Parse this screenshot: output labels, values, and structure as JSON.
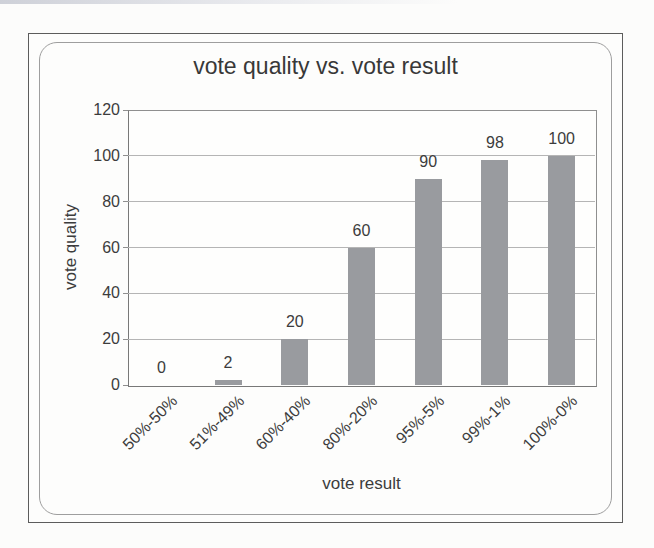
{
  "chart_data": {
    "type": "bar",
    "title": "vote quality vs. vote result",
    "xlabel": "vote result",
    "ylabel": "vote quality",
    "categories": [
      "50%-50%",
      "51%-49%",
      "60%-40%",
      "80%-20%",
      "95%-5%",
      "99%-1%",
      "100%-0%"
    ],
    "values": [
      0,
      2,
      20,
      60,
      90,
      98,
      100
    ],
    "data_labels": [
      "0",
      "2",
      "20",
      "60",
      "90",
      "98",
      "100"
    ],
    "yticks": [
      0,
      20,
      40,
      60,
      80,
      100,
      120
    ],
    "ylim": [
      0,
      120
    ],
    "grid": "horizontal",
    "legend": "none",
    "colors": {
      "bar": "#999b9f",
      "gridline": "#b5b5b5",
      "plot_border": "#8f8f8f",
      "text": "#3c3c3c",
      "frame_border": "#5c5c5c",
      "panel_border": "#9e9e9e"
    }
  }
}
